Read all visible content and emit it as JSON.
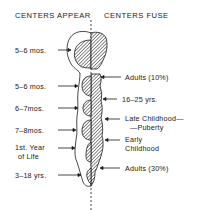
{
  "headers": {
    "left": "CENTERS APPEAR",
    "right": "CENTERS FUSE"
  },
  "left_labels": [
    {
      "id": "appear-1",
      "lines": [
        "5–6 mos."
      ],
      "y": 46
    },
    {
      "id": "appear-2",
      "lines": [
        "5–6 mos."
      ],
      "y": 82
    },
    {
      "id": "appear-3",
      "lines": [
        "6–7mos."
      ],
      "y": 104
    },
    {
      "id": "appear-4",
      "lines": [
        "7–8mos."
      ],
      "y": 126
    },
    {
      "id": "appear-5",
      "lines": [
        "1st. Year",
        "of Life"
      ],
      "y": 144
    },
    {
      "id": "appear-6",
      "lines": [
        "3–18 yrs."
      ],
      "y": 171
    }
  ],
  "right_labels": [
    {
      "id": "fuse-1",
      "lines": [
        "Adults (10%)"
      ],
      "y": 73
    },
    {
      "id": "fuse-2",
      "lines": [
        "16–25 yrs."
      ],
      "y": 95
    },
    {
      "id": "fuse-3",
      "lines": [
        "Late Childhood—",
        "—Puberty"
      ],
      "y": 115
    },
    {
      "id": "fuse-4",
      "lines": [
        "Early",
        "Childhood"
      ],
      "y": 136
    },
    {
      "id": "fuse-5",
      "lines": [
        "Adults (30%)"
      ],
      "y": 164
    }
  ],
  "colors": {
    "ink": "#1a1a1a",
    "background": "#ffffff"
  }
}
